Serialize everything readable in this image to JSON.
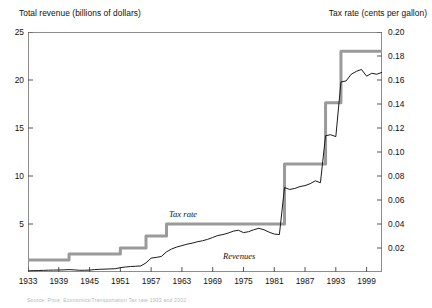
{
  "chart_data": {
    "type": "line",
    "title": "",
    "xlabel": "",
    "ylabel": "Total revenue (billions of dollars)",
    "y2label": "Tax rate (cents per gallon)",
    "grid": false,
    "legend_position": "inline-annotation",
    "xlim": [
      1933,
      2002
    ],
    "ylim": [
      0,
      25
    ],
    "y2lim": [
      0,
      0.2
    ],
    "xticks": [
      1933,
      1939,
      1945,
      1951,
      1957,
      1963,
      1969,
      1975,
      1981,
      1987,
      1993,
      1999
    ],
    "xtick_labels": [
      "1933",
      "1939",
      "1945",
      "1951",
      "1957",
      "1963",
      "1969",
      "1975",
      "1981",
      "1987",
      "1993",
      "1999"
    ],
    "yticks": [
      0,
      5,
      10,
      15,
      20,
      25
    ],
    "ytick_labels": [
      "",
      "5",
      "10",
      "15",
      "20",
      "25"
    ],
    "y2ticks": [
      0.02,
      0.04,
      0.06,
      0.08,
      0.1,
      0.12,
      0.14,
      0.16,
      0.18,
      0.2
    ],
    "y2tick_labels": [
      "0.02",
      "0.04",
      "0.06",
      "0.08",
      "0.10",
      "0.12",
      "0.14",
      "0.16",
      "0.18",
      "0.20"
    ],
    "annotations": [
      {
        "text": "Tax rate",
        "x": 1960.5,
        "y": 5.9,
        "style": "italic"
      },
      {
        "text": "Revenues",
        "x": 1971.0,
        "y": 1.6,
        "style": "italic"
      }
    ],
    "series": [
      {
        "name": "Tax rate",
        "axis": "y2",
        "color": "#9a9a9a",
        "width": 3.0,
        "style": "step",
        "x": [
          1933,
          1940,
          1941,
          1950,
          1951,
          1955,
          1956,
          1959,
          1960,
          1982,
          1983,
          1989,
          1990,
          1991,
          1992,
          1993,
          1994,
          2002
        ],
        "values": [
          0.01,
          0.01,
          0.015,
          0.015,
          0.02,
          0.02,
          0.03,
          0.03,
          0.04,
          0.04,
          0.09,
          0.09,
          0.09,
          0.141,
          0.141,
          0.141,
          0.184,
          0.184
        ]
      },
      {
        "name": "Revenues",
        "axis": "y1",
        "color": "#1a1a1a",
        "width": 1.0,
        "style": "line",
        "x": [
          1933,
          1934,
          1935,
          1936,
          1937,
          1938,
          1939,
          1940,
          1941,
          1942,
          1943,
          1944,
          1945,
          1946,
          1947,
          1948,
          1949,
          1950,
          1951,
          1952,
          1953,
          1954,
          1955,
          1956,
          1957,
          1958,
          1959,
          1960,
          1961,
          1962,
          1963,
          1964,
          1965,
          1966,
          1967,
          1968,
          1969,
          1970,
          1971,
          1972,
          1973,
          1974,
          1975,
          1976,
          1977,
          1978,
          1979,
          1980,
          1981,
          1982,
          1983,
          1984,
          1985,
          1986,
          1987,
          1988,
          1989,
          1990,
          1991,
          1992,
          1993,
          1994,
          1995,
          1996,
          1997,
          1998,
          1999,
          2000,
          2001,
          2002
        ],
        "values": [
          0.12,
          0.14,
          0.15,
          0.17,
          0.19,
          0.2,
          0.21,
          0.22,
          0.25,
          0.22,
          0.18,
          0.18,
          0.2,
          0.25,
          0.28,
          0.3,
          0.32,
          0.34,
          0.45,
          0.52,
          0.57,
          0.6,
          0.63,
          0.95,
          1.45,
          1.52,
          1.62,
          2.1,
          2.4,
          2.6,
          2.75,
          2.9,
          3.0,
          3.15,
          3.25,
          3.4,
          3.6,
          3.8,
          3.9,
          4.05,
          4.25,
          4.35,
          4.1,
          4.2,
          4.4,
          4.55,
          4.4,
          4.15,
          3.95,
          3.9,
          8.8,
          8.6,
          8.7,
          8.9,
          9.0,
          9.2,
          9.5,
          9.3,
          14.2,
          14.3,
          14.1,
          19.8,
          19.9,
          20.6,
          20.9,
          21.1,
          20.4,
          20.7,
          20.6,
          20.8
        ]
      }
    ]
  },
  "source_note": "Source: Price, Economics/Transportation Tax rate 1933 and 2002"
}
